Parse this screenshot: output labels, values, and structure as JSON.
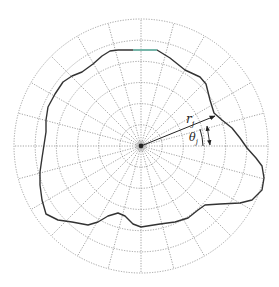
{
  "diagram": {
    "type": "polar-grid-contour",
    "center": {
      "x": 141,
      "y": 146
    },
    "outer_radius": 127,
    "ring_count": 6,
    "spoke_count": 24,
    "colors": {
      "grid": "#8a8a8a",
      "contour": "#333333",
      "highlight": "#7fd8c8",
      "label": "#222222"
    },
    "labels": {
      "radius": "r",
      "radius_sub": "j",
      "angle": "θ",
      "angle_sub": "j"
    },
    "contour_points": [
      [
        118,
        50
      ],
      [
        135,
        50
      ],
      [
        157,
        50
      ],
      [
        170,
        58
      ],
      [
        185,
        70
      ],
      [
        200,
        77
      ],
      [
        206,
        84
      ],
      [
        210,
        100
      ],
      [
        214,
        113
      ],
      [
        222,
        120
      ],
      [
        232,
        128
      ],
      [
        240,
        138
      ],
      [
        247,
        148
      ],
      [
        256,
        158
      ],
      [
        262,
        166
      ],
      [
        264,
        178
      ],
      [
        262,
        190
      ],
      [
        252,
        200
      ],
      [
        240,
        203
      ],
      [
        220,
        204
      ],
      [
        205,
        205
      ],
      [
        198,
        210
      ],
      [
        188,
        218
      ],
      [
        175,
        222
      ],
      [
        160,
        224
      ],
      [
        141,
        227
      ],
      [
        133,
        224
      ],
      [
        125,
        216
      ],
      [
        118,
        213
      ],
      [
        108,
        216
      ],
      [
        98,
        222
      ],
      [
        88,
        225
      ],
      [
        72,
        222
      ],
      [
        58,
        220
      ],
      [
        46,
        214
      ],
      [
        42,
        200
      ],
      [
        40,
        185
      ],
      [
        40,
        172
      ],
      [
        42,
        158
      ],
      [
        44,
        145
      ],
      [
        46,
        132
      ],
      [
        46,
        120
      ],
      [
        48,
        107
      ],
      [
        55,
        94
      ],
      [
        63,
        82
      ],
      [
        72,
        76
      ],
      [
        82,
        72
      ],
      [
        93,
        64
      ],
      [
        102,
        56
      ],
      [
        110,
        51
      ],
      [
        118,
        50
      ]
    ],
    "vector_tip": {
      "x": 215,
      "y": 116
    }
  }
}
